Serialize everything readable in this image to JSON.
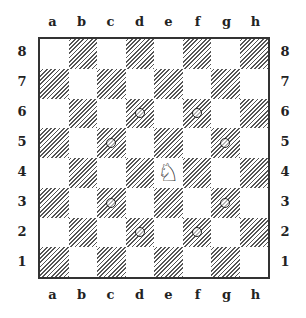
{
  "board": {
    "files": [
      "a",
      "b",
      "c",
      "d",
      "e",
      "f",
      "g",
      "h"
    ],
    "ranks": [
      "8",
      "7",
      "6",
      "5",
      "4",
      "3",
      "2",
      "1"
    ],
    "pieces": [
      {
        "square": "e4",
        "type": "knight",
        "color": "white",
        "glyph": "♘"
      }
    ],
    "markers": [
      {
        "square": "d6",
        "icon": "circle-marker-icon"
      },
      {
        "square": "f6",
        "icon": "circle-marker-icon"
      },
      {
        "square": "c5",
        "icon": "circle-marker-icon"
      },
      {
        "square": "g5",
        "icon": "circle-marker-icon"
      },
      {
        "square": "c3",
        "icon": "circle-marker-icon"
      },
      {
        "square": "g3",
        "icon": "circle-marker-icon"
      },
      {
        "square": "d2",
        "icon": "circle-marker-icon"
      },
      {
        "square": "f2",
        "icon": "circle-marker-icon"
      }
    ],
    "colors": {
      "dark_hatch": "#555555",
      "light": "#ffffff",
      "border": "#333333"
    }
  }
}
